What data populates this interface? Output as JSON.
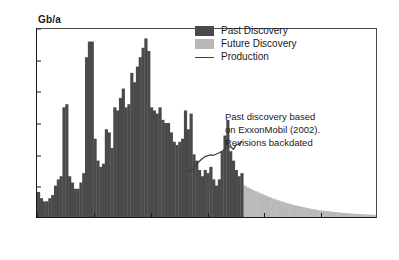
{
  "chart_data": {
    "type": "bar",
    "title": "",
    "subtitle": "",
    "xlabel": "",
    "ylabel": "Gb/a",
    "xlim": [
      1930,
      2050
    ],
    "ylim": [
      0,
      60
    ],
    "grid": false,
    "legend_position": "top-right",
    "ytick_labels": [
      "0",
      "10",
      "20",
      "30",
      "40",
      "50",
      "60"
    ],
    "ytick_values": [
      0,
      10,
      20,
      30,
      40,
      50,
      60
    ],
    "xtick_labels": [
      "1930",
      "1950",
      "1970",
      "1990",
      "2010",
      "2030",
      "2050"
    ],
    "xtick_values": [
      1930,
      1950,
      1970,
      1990,
      2010,
      2030,
      2050
    ],
    "colors": {
      "past_discovery": "#4a4a4a",
      "future_discovery": "#b9b9b9",
      "production": "#3d3d3d",
      "axis": "#1a1a1a",
      "background": "#ffffff"
    },
    "series": [
      {
        "name": "Past Discovery",
        "type": "bar",
        "color": "#4a4a4a",
        "x": [
          1930,
          1931,
          1932,
          1933,
          1934,
          1935,
          1936,
          1937,
          1938,
          1939,
          1940,
          1941,
          1942,
          1943,
          1944,
          1945,
          1946,
          1947,
          1948,
          1949,
          1950,
          1951,
          1952,
          1953,
          1954,
          1955,
          1956,
          1957,
          1958,
          1959,
          1960,
          1961,
          1962,
          1963,
          1964,
          1965,
          1966,
          1967,
          1968,
          1969,
          1970,
          1971,
          1972,
          1973,
          1974,
          1975,
          1976,
          1977,
          1978,
          1979,
          1980,
          1981,
          1982,
          1983,
          1984,
          1985,
          1986,
          1987,
          1988,
          1989,
          1990,
          1991,
          1992,
          1993,
          1994,
          1995,
          1996,
          1997,
          1998,
          1999,
          2000,
          2001,
          2002
        ],
        "values": [
          8,
          6,
          5,
          5,
          6,
          7,
          10,
          12,
          13,
          35,
          36,
          13,
          11,
          9,
          9,
          11,
          14,
          51,
          56,
          56,
          25,
          18,
          16,
          17,
          28,
          27,
          22,
          35,
          34,
          38,
          41,
          35,
          36,
          46,
          43,
          48,
          51,
          54,
          57,
          53,
          35,
          34,
          33,
          35,
          31,
          30,
          30,
          27,
          24,
          23,
          24,
          25,
          34,
          28,
          33,
          20,
          18,
          15,
          13,
          15,
          14,
          16,
          12,
          10,
          12,
          21,
          26,
          31,
          21,
          18,
          15,
          13,
          14
        ]
      },
      {
        "name": "Future Discovery",
        "type": "bar",
        "color": "#b9b9b9",
        "x": [
          2003,
          2004,
          2005,
          2006,
          2007,
          2008,
          2009,
          2010,
          2011,
          2012,
          2013,
          2014,
          2015,
          2016,
          2017,
          2018,
          2019,
          2020,
          2021,
          2022,
          2023,
          2024,
          2025,
          2026,
          2027,
          2028,
          2029,
          2030,
          2031,
          2032,
          2033,
          2034,
          2035,
          2036,
          2037,
          2038,
          2039,
          2040,
          2041,
          2042,
          2043,
          2044,
          2045,
          2046,
          2047,
          2048,
          2049,
          2050
        ],
        "values": [
          10.0,
          9.5,
          9.0,
          8.6,
          8.2,
          7.8,
          7.4,
          7.0,
          6.6,
          6.3,
          5.9,
          5.6,
          5.3,
          5.0,
          4.7,
          4.4,
          4.2,
          3.9,
          3.7,
          3.5,
          3.3,
          3.1,
          2.9,
          2.7,
          2.5,
          2.4,
          2.2,
          2.1,
          2.0,
          1.9,
          1.8,
          1.7,
          1.6,
          1.5,
          1.4,
          1.3,
          1.2,
          1.2,
          1.1,
          1.0,
          1.0,
          0.9,
          0.9,
          0.8,
          0.8,
          0.7,
          0.7,
          0.6
        ]
      },
      {
        "name": "Production",
        "type": "line",
        "color": "#3d3d3d",
        "x": [
          1983,
          1984,
          1985,
          1986,
          1987,
          1988,
          1989,
          1990,
          1991,
          1992,
          1993,
          1994,
          1995,
          1996,
          1997,
          1998,
          1999,
          2000,
          2001,
          2002
        ],
        "values": [
          14.5,
          15.0,
          15.3,
          17.0,
          17.8,
          18.6,
          19.3,
          19.6,
          19.8,
          19.7,
          20.1,
          20.5,
          21.0,
          21.6,
          22.2,
          22.5,
          21.6,
          23.0,
          23.3,
          24.2
        ]
      }
    ]
  },
  "legend": {
    "items": [
      {
        "label": "Past Discovery",
        "marker": "swatch",
        "color": "#4a4a4a"
      },
      {
        "label": "Future Discovery",
        "marker": "swatch",
        "color": "#b9b9b9"
      },
      {
        "label": "Production",
        "marker": "line",
        "color": "#3d3d3d"
      }
    ]
  },
  "annotation": {
    "line1": "Past discovery based",
    "line2": "on ExxonMobil (2002).",
    "line3": "Revisions backdated"
  }
}
